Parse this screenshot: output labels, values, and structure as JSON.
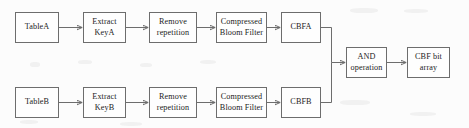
{
  "diagram": {
    "type": "flowchart",
    "title": "",
    "nodes": [
      {
        "id": "tableA",
        "label": "TableA",
        "row": "top"
      },
      {
        "id": "extractA",
        "label": "Extract\nKeyA",
        "row": "top"
      },
      {
        "id": "removeA",
        "label": "Remove\nrepetition",
        "row": "top"
      },
      {
        "id": "cbfilterA",
        "label": "Compressed\nBloom Filter",
        "row": "top"
      },
      {
        "id": "cbfa",
        "label": "CBFA",
        "row": "top"
      },
      {
        "id": "tableB",
        "label": "TableB",
        "row": "bottom"
      },
      {
        "id": "extractB",
        "label": "Extract\nKeyB",
        "row": "bottom"
      },
      {
        "id": "removeB",
        "label": "Remove\nrepetition",
        "row": "bottom"
      },
      {
        "id": "cbfilterB",
        "label": "Compressed\nBloom Filter",
        "row": "bottom"
      },
      {
        "id": "cbfb",
        "label": "CBFB",
        "row": "bottom"
      },
      {
        "id": "and",
        "label": "AND\noperation",
        "row": "middle"
      },
      {
        "id": "cbfbits",
        "label": "CBF bit\narray",
        "row": "middle"
      }
    ],
    "edges": [
      {
        "from": "tableA",
        "to": "extractA"
      },
      {
        "from": "extractA",
        "to": "removeA"
      },
      {
        "from": "removeA",
        "to": "cbfilterA"
      },
      {
        "from": "cbfilterA",
        "to": "cbfa"
      },
      {
        "from": "cbfa",
        "to": "and"
      },
      {
        "from": "tableB",
        "to": "extractB"
      },
      {
        "from": "extractB",
        "to": "removeB"
      },
      {
        "from": "removeB",
        "to": "cbfilterB"
      },
      {
        "from": "cbfilterB",
        "to": "cbfb"
      },
      {
        "from": "cbfb",
        "to": "and"
      },
      {
        "from": "and",
        "to": "cbfbits"
      }
    ],
    "colors": {
      "background": "#fcfcfc",
      "box_border": "#6d6d6d",
      "box_fill": "#fefefe",
      "edge": "#6d6d6d",
      "text": "#1c1c1c"
    }
  }
}
